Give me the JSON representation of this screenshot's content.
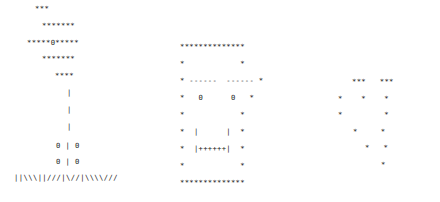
{
  "figures": {
    "tree": {
      "label": "tree",
      "lines": [
        {
          "text": "***",
          "x": 35,
          "y": 9
        },
        {
          "text": "*******",
          "x": 42,
          "y": 26
        },
        {
          "text": "*****0*****",
          "x": 27,
          "y": 43
        },
        {
          "text": "*******",
          "x": 42,
          "y": 59
        },
        {
          "text": "****",
          "x": 55,
          "y": 76
        },
        {
          "text": "|",
          "x": 67,
          "y": 93
        },
        {
          "text": "|",
          "x": 67,
          "y": 110
        },
        {
          "text": "|",
          "x": 67,
          "y": 127
        },
        {
          "text": "0 | 0",
          "x": 56,
          "y": 146
        },
        {
          "text": "0 | 0",
          "x": 56,
          "y": 162
        },
        {
          "text": "||\\\\\\||///|\\//|\\\\\\\\///",
          "x": 14,
          "y": 178
        }
      ]
    },
    "face": {
      "label": "face-in-box",
      "lines": [
        {
          "text": "**************",
          "x": 180,
          "y": 47
        },
        {
          "text": "*            *",
          "x": 180,
          "y": 64
        },
        {
          "text": "* ------  ------ *",
          "x": 180,
          "y": 81
        },
        {
          "text": "*   0      0   *",
          "x": 180,
          "y": 98
        },
        {
          "text": "*            *",
          "x": 180,
          "y": 115
        },
        {
          "text": "*  |      |  *",
          "x": 180,
          "y": 132
        },
        {
          "text": "*  |++++++|  *",
          "x": 180,
          "y": 149
        },
        {
          "text": "*            *",
          "x": 180,
          "y": 166
        },
        {
          "text": "**************",
          "x": 180,
          "y": 183
        }
      ]
    },
    "heart": {
      "label": "heart",
      "lines": [
        {
          "text": "***   ***",
          "x": 352,
          "y": 82
        },
        {
          "text": "*    *    *",
          "x": 338,
          "y": 99
        },
        {
          "text": "*         *",
          "x": 338,
          "y": 115
        },
        {
          "text": "*     *",
          "x": 353,
          "y": 132
        },
        {
          "text": "*   *",
          "x": 365,
          "y": 148
        },
        {
          "text": "*",
          "x": 381,
          "y": 165
        }
      ]
    }
  },
  "caption": ""
}
